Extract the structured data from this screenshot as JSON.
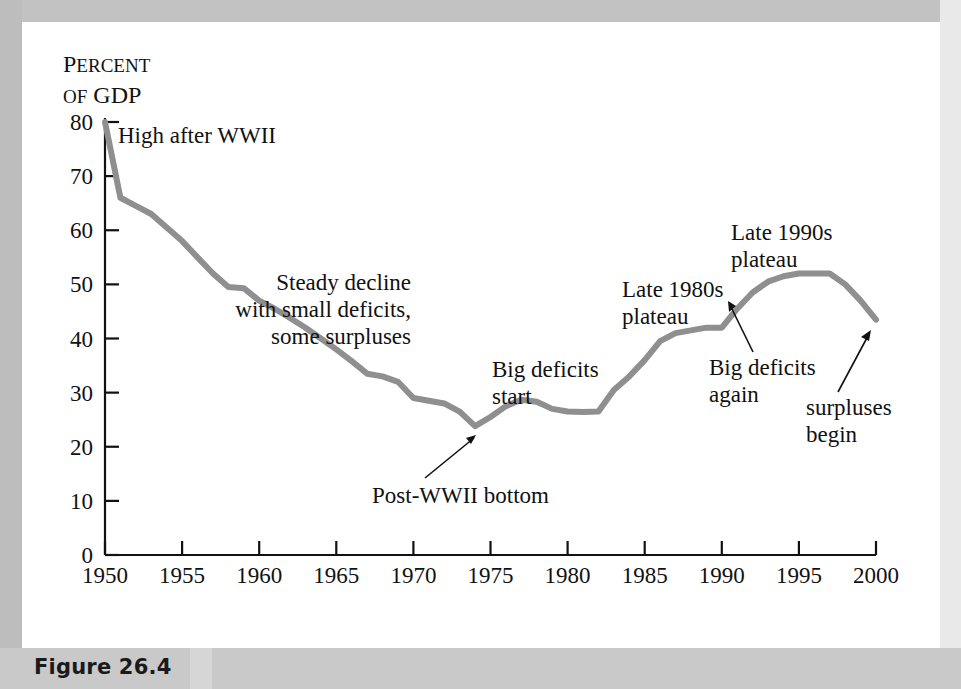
{
  "figure": {
    "caption_label": "Figure 26.4"
  },
  "chart_data": {
    "type": "line",
    "title": "",
    "subtitle": "",
    "xlabel": "",
    "ylabel": "Percent of GDP",
    "ylabel_lines": [
      "Percent",
      "of GDP"
    ],
    "ylabel_line1_small_caps": "ERCENT",
    "ylabel_line1_initial": "P",
    "ylabel_line2_small_caps": "OF",
    "ylabel_line2_rest": "GDP",
    "xlim": [
      1950,
      2000
    ],
    "ylim": [
      0,
      80
    ],
    "grid": false,
    "legend": "none",
    "y_ticks": [
      0,
      10,
      20,
      30,
      40,
      50,
      60,
      70,
      80
    ],
    "y_tick_labels": [
      "0",
      "10",
      "20",
      "30",
      "40",
      "50",
      "60",
      "70",
      "80"
    ],
    "x_ticks": [
      1950,
      1955,
      1960,
      1965,
      1970,
      1975,
      1980,
      1985,
      1990,
      1995,
      2000
    ],
    "x_tick_labels": [
      "1950",
      "1955",
      "1960",
      "1965",
      "1970",
      "1975",
      "1980",
      "1985",
      "1990",
      "1995",
      "2000"
    ],
    "series_name": "Federal debt held by the public",
    "line_color": "#8f8f8f",
    "line_width_px": 6,
    "x": [
      1950,
      1951,
      1952,
      1953,
      1954,
      1955,
      1956,
      1957,
      1958,
      1959,
      1960,
      1961,
      1962,
      1963,
      1964,
      1965,
      1966,
      1967,
      1968,
      1969,
      1970,
      1971,
      1972,
      1973,
      1974,
      1975,
      1976,
      1977,
      1978,
      1979,
      1980,
      1981,
      1982,
      1983,
      1984,
      1985,
      1986,
      1987,
      1988,
      1989,
      1990,
      1991,
      1992,
      1993,
      1994,
      1995,
      1996,
      1997,
      1998,
      1999,
      2000
    ],
    "values": [
      80.0,
      66.0,
      64.5,
      63.0,
      60.5,
      58.0,
      55.0,
      52.0,
      49.5,
      49.3,
      47.0,
      45.5,
      43.8,
      42.0,
      40.0,
      38.0,
      35.8,
      33.5,
      33.0,
      32.0,
      29.0,
      28.5,
      28.0,
      26.5,
      23.8,
      25.5,
      27.5,
      28.7,
      28.3,
      27.0,
      26.5,
      26.4,
      26.5,
      30.5,
      33.0,
      36.0,
      39.5,
      41.0,
      41.5,
      42.0,
      42.0,
      45.5,
      48.5,
      50.5,
      51.5,
      52.0,
      52.0,
      52.0,
      50.0,
      47.0,
      43.5
    ]
  },
  "annotations": [
    {
      "id": "high-after-wwii",
      "lines": [
        "High after WWII"
      ],
      "align": "left",
      "has_arrow": false
    },
    {
      "id": "steady-decline",
      "lines": [
        "Steady decline",
        "with small deficits,",
        "some surpluses"
      ],
      "align": "right",
      "has_arrow": false
    },
    {
      "id": "post-wwii-bottom",
      "lines": [
        "Post-WWII bottom"
      ],
      "align": "left",
      "has_arrow": true
    },
    {
      "id": "big-deficits-start",
      "lines": [
        "Big deficits",
        "start"
      ],
      "align": "left",
      "has_arrow": false
    },
    {
      "id": "late-1980s-plateau",
      "lines": [
        "Late 1980s",
        "plateau"
      ],
      "align": "left",
      "has_arrow": false
    },
    {
      "id": "late-1990s-plateau",
      "lines": [
        "Late 1990s",
        "plateau"
      ],
      "align": "left",
      "has_arrow": false
    },
    {
      "id": "big-deficits-again",
      "lines": [
        "Big deficits",
        "again"
      ],
      "align": "left",
      "has_arrow": true
    },
    {
      "id": "surpluses-begin",
      "lines": [
        "surpluses",
        "begin"
      ],
      "align": "left",
      "has_arrow": true
    }
  ]
}
